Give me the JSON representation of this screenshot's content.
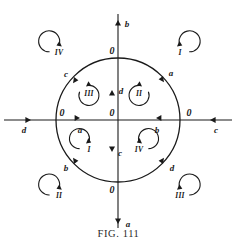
{
  "figure": {
    "caption": "FIG. 111",
    "ink_color": "#1a1a1a",
    "background_color": "#ffffff",
    "geometry": {
      "center_x": 118,
      "center_y": 120,
      "circle_radius": 62
    }
  },
  "origin_label": "0",
  "axis_endpoint_labels": {
    "top": "b",
    "bottom": "a",
    "left": "d",
    "right": "c"
  },
  "inner_axis_labels": {
    "up_of_center": "d",
    "down_of_center": "c",
    "left_of_center": "a",
    "right_of_center": "b"
  },
  "circle_intersection_zeros": [
    {
      "label": "0",
      "position": "top"
    },
    {
      "label": "0",
      "position": "bottom"
    },
    {
      "label": "0",
      "position": "left"
    },
    {
      "label": "0",
      "position": "right"
    }
  ],
  "arc_labels": [
    {
      "label": "a",
      "position": "upper-right"
    },
    {
      "label": "c",
      "position": "upper-left"
    },
    {
      "label": "b",
      "position": "lower-left"
    },
    {
      "label": "d",
      "position": "lower-right"
    }
  ],
  "inner_quadrant_markers": [
    {
      "label": "III",
      "quadrant": "upper-left"
    },
    {
      "label": "II",
      "quadrant": "upper-right"
    },
    {
      "label": "I",
      "quadrant": "lower-left"
    },
    {
      "label": "IV",
      "quadrant": "lower-right"
    }
  ],
  "outer_corner_markers": [
    {
      "label": "IV",
      "corner": "top-left"
    },
    {
      "label": "I",
      "corner": "top-right"
    },
    {
      "label": "II",
      "corner": "bottom-left"
    },
    {
      "label": "III",
      "corner": "bottom-right"
    }
  ]
}
